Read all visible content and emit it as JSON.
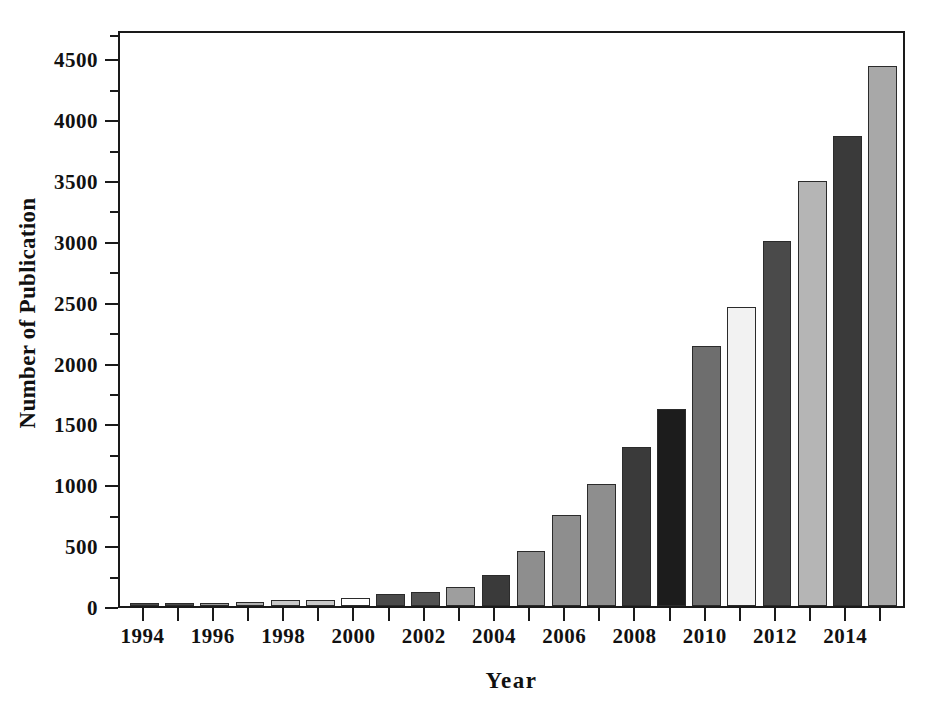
{
  "chart_data": {
    "type": "bar",
    "title": "",
    "xlabel": "Year",
    "ylabel": "Number of Publication",
    "xlim": [
      1993.3,
      2015.7
    ],
    "ylim": [
      0,
      4740
    ],
    "grid": false,
    "legend": null,
    "y_major_ticks": [
      0,
      500,
      1000,
      1500,
      2000,
      2500,
      3000,
      3500,
      4000,
      4500
    ],
    "y_minor_ticks": [
      250,
      750,
      1250,
      1750,
      2250,
      2750,
      3250,
      3750,
      4250,
      4700
    ],
    "y_tick_labels": [
      "0",
      "500",
      "1000",
      "1500",
      "2000",
      "2500",
      "3000",
      "3500",
      "4000",
      "4500"
    ],
    "x_tick_values": [
      1994,
      1995,
      1996,
      1997,
      1998,
      1999,
      2000,
      2001,
      2002,
      2003,
      2004,
      2005,
      2006,
      2007,
      2008,
      2009,
      2010,
      2011,
      2012,
      2013,
      2014,
      2015
    ],
    "x_tick_labels": [
      "1994",
      "",
      "1996",
      "",
      "1998",
      "",
      "2000",
      "",
      "2002",
      "",
      "2004",
      "",
      "2006",
      "",
      "2008",
      "",
      "2010",
      "",
      "2012",
      "",
      "2014",
      ""
    ],
    "categories": [
      1994,
      1995,
      1996,
      1997,
      1998,
      1999,
      2000,
      2001,
      2002,
      2003,
      2004,
      2005,
      2006,
      2007,
      2008,
      2009,
      2010,
      2011,
      2012,
      2013,
      2014,
      2015
    ],
    "values": [
      15,
      20,
      25,
      30,
      50,
      50,
      65,
      95,
      115,
      160,
      255,
      455,
      745,
      1000,
      1310,
      1620,
      2135,
      2460,
      3000,
      3490,
      3865,
      4440
    ],
    "bar_fills": [
      "#4a4a4a",
      "#4a4a4a",
      "#9a9a9a",
      "#b0b0b0",
      "#c9c9c9",
      "#c9c9c9",
      "#ffffff",
      "#4a4a4a",
      "#525252",
      "#9e9e9e",
      "#3a3a3a",
      "#8e8e8e",
      "#8e8e8e",
      "#8e8e8e",
      "#3a3a3a",
      "#1c1c1c",
      "#6e6e6e",
      "#f2f2f2",
      "#4a4a4a",
      "#b5b5b5",
      "#3a3a3a",
      "#a8a8a8"
    ],
    "bar_edge_color": "#2b2b2b",
    "axis_color": "#1a1a1a",
    "background_color": "#ffffff"
  },
  "axis_titles": {
    "y": "Number of Publication",
    "x": "Year"
  }
}
